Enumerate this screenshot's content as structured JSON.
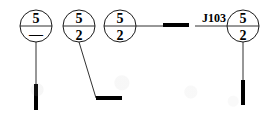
{
  "diagram": {
    "type": "engineering-callout",
    "stroke_color": "#1a1a1a",
    "terminal_color": "#000000",
    "background_color": "#ffffff",
    "reference_label": "J103",
    "balloons": [
      {
        "id": "balloon-1",
        "upper_value": "5",
        "lower_value": "—",
        "cx": 36,
        "cy": 26,
        "r": 16,
        "leader": {
          "kind": "vertical",
          "x1": 36,
          "y1": 42,
          "x2": 36,
          "y2": 88
        },
        "terminal": {
          "kind": "vertical-bar",
          "x": 36,
          "y1": 84,
          "y2": 110,
          "thickness": 4
        }
      },
      {
        "id": "balloon-2",
        "upper_value": "5",
        "lower_value": "2",
        "cx": 79,
        "cy": 26,
        "r": 16,
        "leader": {
          "kind": "diagonal",
          "x1": 79,
          "y1": 42,
          "x2": 96,
          "y2": 98
        },
        "terminal": {
          "kind": "horizontal-bar",
          "x1": 96,
          "x2": 122,
          "y": 98,
          "thickness": 4
        }
      },
      {
        "id": "balloon-3",
        "upper_value": "5",
        "lower_value": "2",
        "cx": 120,
        "cy": 26,
        "r": 16,
        "leader": {
          "kind": "horizontal",
          "x1": 136,
          "y1": 26,
          "x2": 163,
          "y2": 26
        },
        "terminal": {
          "kind": "horizontal-bar",
          "x1": 163,
          "x2": 189,
          "y": 25,
          "thickness": 4
        }
      },
      {
        "id": "balloon-4",
        "upper_value": "5",
        "lower_value": "2",
        "cx": 243,
        "cy": 26,
        "r": 16,
        "leader": {
          "kind": "vertical",
          "x1": 243,
          "y1": 42,
          "x2": 243,
          "y2": 82
        },
        "terminal": {
          "kind": "vertical-bar",
          "x": 243,
          "y1": 80,
          "y2": 105,
          "thickness": 4
        }
      }
    ],
    "reference": {
      "label": "J103",
      "text_x": 210,
      "text_y": 22,
      "underline": {
        "x1": 195,
        "x2": 243,
        "y": 26
      }
    }
  }
}
